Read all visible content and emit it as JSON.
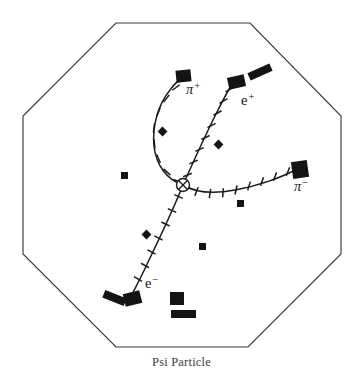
{
  "figure": {
    "caption": "Psi Particle",
    "detector_shape": "octagon",
    "vertex_marker": "circle-with-cross",
    "outline_color": "#3a3a3c",
    "ink_color": "#141414",
    "background_color": "#ffffff"
  },
  "chart_data": {
    "type": "scatter",
    "title": "Psi Particle",
    "xlabel": "",
    "ylabel": "",
    "grid": false,
    "legend": "none",
    "xlim": [
      0,
      363
    ],
    "ylim": [
      0,
      383
    ],
    "detector_outline": {
      "name": "octagonal-detector-boundary",
      "points": [
        [
          116,
          23
        ],
        [
          250,
          23
        ],
        [
          341,
          116
        ],
        [
          341,
          254
        ],
        [
          248,
          347
        ],
        [
          116,
          347
        ],
        [
          23,
          254
        ],
        [
          23,
          116
        ]
      ]
    },
    "interaction_vertex": {
      "name": "interaction-vertex",
      "x": 183,
      "y": 185,
      "radius": 6.5
    },
    "series": [
      {
        "name": "pi-plus",
        "label": "π",
        "charge_sign": "+",
        "label_x": 186,
        "label_y": 94,
        "curvature": "left-bending",
        "path": "M 183 185 C 167 180 156 165 154 146 C 152 126 158 105 170 90 C 175 83 181 78 186 75",
        "ticks": [
          {
            "x": 177.5,
            "y": 181.0,
            "angle": 20
          },
          {
            "x": 167.0,
            "y": 172.0,
            "angle": 42
          },
          {
            "x": 158.5,
            "y": 158.5,
            "angle": 66
          },
          {
            "x": 154.5,
            "y": 144.0,
            "angle": 84
          },
          {
            "x": 154.0,
            "y": 128.0,
            "angle": 97
          },
          {
            "x": 158.5,
            "y": 112.0,
            "angle": 112
          },
          {
            "x": 166.5,
            "y": 98.5,
            "angle": 128
          },
          {
            "x": 176.0,
            "y": 87.5,
            "angle": 143
          }
        ]
      },
      {
        "name": "e-plus",
        "label": "e",
        "charge_sign": "+",
        "label_x": 241,
        "label_y": 105,
        "curvature": "slightly-curved",
        "path": "M 183 185 C 191 167 203 140 216 114 C 223 100 230 87 235 79",
        "ticks": [
          {
            "x": 187.5,
            "y": 175.0,
            "angle": 158
          },
          {
            "x": 193.5,
            "y": 162.0,
            "angle": 156
          },
          {
            "x": 199.5,
            "y": 149.5,
            "angle": 155
          },
          {
            "x": 205.5,
            "y": 137.5,
            "angle": 154
          },
          {
            "x": 211.5,
            "y": 125.5,
            "angle": 152
          },
          {
            "x": 217.5,
            "y": 113.0,
            "angle": 151
          },
          {
            "x": 223.5,
            "y": 101.0,
            "angle": 150
          },
          {
            "x": 229.5,
            "y": 89.5,
            "angle": 148
          }
        ]
      },
      {
        "name": "pi-minus",
        "label": "π",
        "charge_sign": "−",
        "label_x": 294,
        "label_y": 191,
        "curvature": "right-bending",
        "path": "M 183 185 C 196 193 214 194 235 190 C 258 186 283 177 299 168",
        "ticks": [
          {
            "x": 196.5,
            "y": 191.5,
            "angle": 112
          },
          {
            "x": 210.0,
            "y": 193.5,
            "angle": 99
          },
          {
            "x": 223.0,
            "y": 192.8,
            "angle": 94
          },
          {
            "x": 236.0,
            "y": 190.0,
            "angle": 103
          },
          {
            "x": 249.0,
            "y": 186.0,
            "angle": 107
          },
          {
            "x": 262.0,
            "y": 181.5,
            "angle": 109
          },
          {
            "x": 275.0,
            "y": 176.5,
            "angle": 110
          },
          {
            "x": 288.0,
            "y": 171.5,
            "angle": 112
          }
        ]
      },
      {
        "name": "e-minus",
        "label": "e",
        "charge_sign": "−",
        "label_x": 145,
        "label_y": 288,
        "curvature": "slightly-curved",
        "path": "M 183 185 C 175 205 162 233 150 258 C 143 273 136 287 131 296",
        "ticks": [
          {
            "x": 178.5,
            "y": 196.5,
            "angle": 24
          },
          {
            "x": 172.0,
            "y": 210.5,
            "angle": 25
          },
          {
            "x": 165.5,
            "y": 224.0,
            "angle": 26
          },
          {
            "x": 158.5,
            "y": 238.0,
            "angle": 27
          },
          {
            "x": 151.5,
            "y": 252.0,
            "angle": 28
          },
          {
            "x": 145.0,
            "y": 265.5,
            "angle": 29
          },
          {
            "x": 138.0,
            "y": 279.0,
            "angle": 30
          }
        ]
      }
    ],
    "calorimeter_hits": [
      {
        "name": "hit-pi-plus-endpoint",
        "x": 176,
        "y": 70,
        "w": 15,
        "h": 12,
        "rotation": -6
      },
      {
        "name": "hit-e-plus-endpoint",
        "x": 228,
        "y": 76,
        "w": 17,
        "h": 12,
        "rotation": -12
      },
      {
        "name": "hit-e-plus-outer-bar",
        "x": 248,
        "y": 68,
        "w": 24,
        "h": 8,
        "rotation": -24
      },
      {
        "name": "hit-pi-minus-endpoint",
        "x": 292,
        "y": 161,
        "w": 16,
        "h": 17,
        "rotation": -8
      },
      {
        "name": "hit-e-minus-endpoint",
        "x": 124,
        "y": 292,
        "w": 17,
        "h": 13,
        "rotation": -14
      },
      {
        "name": "hit-e-minus-outer-bar",
        "x": 103,
        "y": 294,
        "w": 23,
        "h": 8,
        "rotation": 22
      },
      {
        "name": "hit-bottom-square",
        "x": 170,
        "y": 292,
        "w": 14,
        "h": 13,
        "rotation": 0
      },
      {
        "name": "hit-bottom-bar",
        "x": 171,
        "y": 310,
        "w": 25,
        "h": 8,
        "rotation": 0
      }
    ],
    "noise_hits": [
      {
        "name": "noise-hit-left-center",
        "x": 121,
        "y": 172,
        "w": 7,
        "h": 7,
        "rotation": 0
      },
      {
        "name": "noise-hit-pi-plus-inner",
        "x": 159,
        "y": 128,
        "w": 7,
        "h": 7,
        "rotation": 45
      },
      {
        "name": "noise-hit-e-plus-inner",
        "x": 215,
        "y": 141,
        "w": 7,
        "h": 7,
        "rotation": 45
      },
      {
        "name": "noise-hit-below-pi-minus",
        "x": 237,
        "y": 200,
        "w": 7,
        "h": 7,
        "rotation": 0
      },
      {
        "name": "noise-hit-e-minus-inner",
        "x": 143,
        "y": 231,
        "w": 7,
        "h": 7,
        "rotation": 45
      },
      {
        "name": "noise-hit-lower-center",
        "x": 199,
        "y": 243,
        "w": 7,
        "h": 7,
        "rotation": 0
      }
    ]
  }
}
